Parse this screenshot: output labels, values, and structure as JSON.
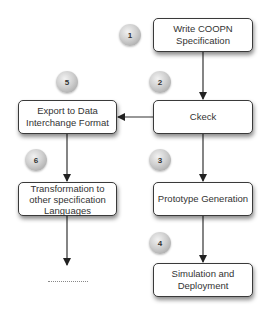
{
  "diagram": {
    "nodes": [
      {
        "id": "write",
        "label": "Write COOPN Specification"
      },
      {
        "id": "check",
        "label": "Ckeck"
      },
      {
        "id": "export",
        "label": "Export to Data Interchange Format"
      },
      {
        "id": "transform",
        "label": "Transformation to other specification Languages"
      },
      {
        "id": "prototype",
        "label": "Prototype Generation"
      },
      {
        "id": "simulation",
        "label": "Simulation and Deployment"
      }
    ],
    "steps": [
      "1",
      "2",
      "3",
      "4",
      "5",
      "6"
    ],
    "edges": [
      {
        "from": "write",
        "to": "check"
      },
      {
        "from": "check",
        "to": "export"
      },
      {
        "from": "check",
        "to": "prototype"
      },
      {
        "from": "prototype",
        "to": "simulation"
      },
      {
        "from": "export",
        "to": "transform"
      },
      {
        "from": "transform",
        "to": "continuation"
      }
    ],
    "continuation": "..............",
    "colors": {
      "line": "#333333",
      "box_border": "#3a3a3a",
      "ball": "#cfcfcf"
    }
  }
}
